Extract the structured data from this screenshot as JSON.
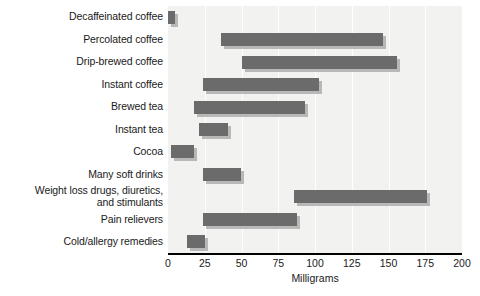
{
  "chart_data": {
    "type": "bar",
    "subtype": "range-bar",
    "title": "",
    "xlabel": "Milligrams",
    "ylabel": "",
    "xlim": [
      0,
      200
    ],
    "xticks": [
      0,
      25,
      50,
      75,
      100,
      125,
      150,
      175,
      200
    ],
    "xtick_labels": [
      "0",
      "25",
      "50",
      "75",
      "100",
      "125",
      "150",
      "175",
      "200"
    ],
    "grid": true,
    "grid_axis": "x",
    "legend": "none",
    "orientation": "horizontal",
    "categories": [
      "Decaffeinated coffee",
      "Percolated coffee",
      "Drip-brewed coffee",
      "Instant coffee",
      "Brewed tea",
      "Instant tea",
      "Cocoa",
      "Many soft drinks",
      "Weight loss drugs, diuretics,\nand stimulants",
      "Pain relievers",
      "Cold/allergy remedies"
    ],
    "ranges": [
      {
        "label": "Decaffeinated coffee",
        "low": 0,
        "high": 5
      },
      {
        "label": "Percolated coffee",
        "low": 36,
        "high": 146
      },
      {
        "label": "Drip-brewed coffee",
        "low": 50,
        "high": 156
      },
      {
        "label": "Instant coffee",
        "low": 24,
        "high": 103
      },
      {
        "label": "Brewed tea",
        "low": 18,
        "high": 93
      },
      {
        "label": "Instant tea",
        "low": 21,
        "high": 41
      },
      {
        "label": "Cocoa",
        "low": 2,
        "high": 18
      },
      {
        "label": "Many soft drinks",
        "low": 24,
        "high": 50
      },
      {
        "label": "Weight loss drugs, diuretics, and stimulants",
        "low": 86,
        "high": 176
      },
      {
        "label": "Pain relievers",
        "low": 24,
        "high": 88
      },
      {
        "label": "Cold/allergy remedies",
        "low": 13,
        "high": 25
      }
    ],
    "colors": {
      "bar": "#6b6b6b",
      "bar_shadow": "#b8b8b8",
      "panel_background": "#f2f2f0",
      "gridline": "#ffffff",
      "axis": "#000000",
      "text": "#1a1a1a"
    }
  }
}
